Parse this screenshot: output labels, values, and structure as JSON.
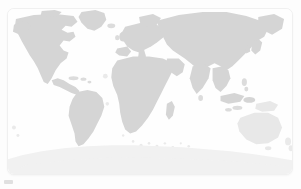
{
  "page": {
    "background_color": "#fdfdfd"
  },
  "card": {
    "background_color": "#ffffff",
    "border_color": "#f0f0f0",
    "corner_radius_px": 7
  },
  "map": {
    "name": "world-map",
    "projection": "equirectangular",
    "ocean_color": "#fefefe",
    "land_color": "#d5d5d5",
    "land_faint_color": "#e8e8e8",
    "antarctica_color": "#f1f1f1",
    "regions": [
      {
        "id": "north-america",
        "label": "North America",
        "shade": "land"
      },
      {
        "id": "central-america",
        "label": "Central America",
        "shade": "land"
      },
      {
        "id": "greenland",
        "label": "Greenland",
        "shade": "land"
      },
      {
        "id": "south-america",
        "label": "South America",
        "shade": "land"
      },
      {
        "id": "europe",
        "label": "Europe",
        "shade": "land"
      },
      {
        "id": "africa",
        "label": "Africa",
        "shade": "land"
      },
      {
        "id": "madagascar",
        "label": "Madagascar",
        "shade": "land"
      },
      {
        "id": "asia",
        "label": "Asia",
        "shade": "land"
      },
      {
        "id": "arabia",
        "label": "Arabian Peninsula",
        "shade": "land"
      },
      {
        "id": "india",
        "label": "India",
        "shade": "land"
      },
      {
        "id": "southeast-asia",
        "label": "Southeast Asia",
        "shade": "land"
      },
      {
        "id": "japan",
        "label": "Japan",
        "shade": "land"
      },
      {
        "id": "indonesia",
        "label": "Indonesia",
        "shade": "land"
      },
      {
        "id": "new-guinea",
        "label": "New Guinea",
        "shade": "land-faint"
      },
      {
        "id": "australia",
        "label": "Australia",
        "shade": "land-faint"
      },
      {
        "id": "new-zealand",
        "label": "New Zealand",
        "shade": "land-faint"
      },
      {
        "id": "antarctica",
        "label": "Antarctica",
        "shade": "land-ice"
      },
      {
        "id": "british-isles",
        "label": "British Isles",
        "shade": "land"
      },
      {
        "id": "iceland",
        "label": "Iceland",
        "shade": "islet"
      },
      {
        "id": "caribbean",
        "label": "Caribbean Islands",
        "shade": "islet"
      },
      {
        "id": "sri-lanka",
        "label": "Sri Lanka",
        "shade": "islet"
      },
      {
        "id": "philippines",
        "label": "Philippines",
        "shade": "islet"
      },
      {
        "id": "pacific-islets",
        "label": "Pacific Islands",
        "shade": "islet-faint"
      },
      {
        "id": "southern-islets",
        "label": "Southern Ocean Islands",
        "shade": "islet-faint"
      }
    ]
  },
  "brand": {
    "mark_color": "#c9c9c9",
    "label": ""
  }
}
